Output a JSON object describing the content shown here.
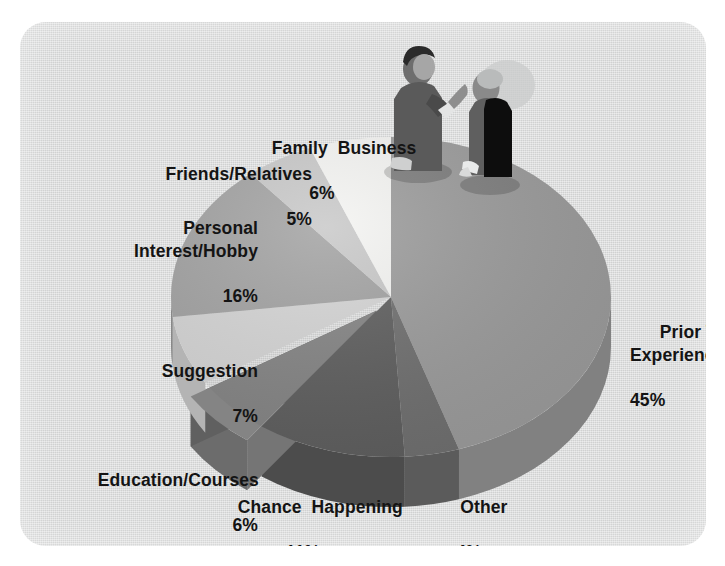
{
  "panel": {
    "background_color": "#d9dada",
    "border_radius_px": 26
  },
  "chart_data": {
    "type": "pie",
    "title": "",
    "subtitle": "",
    "xlabel": "",
    "ylabel": "",
    "style": "3d-exploded-pie",
    "legend_position": "none",
    "labels_position": "outside",
    "value_suffix": "%",
    "total": 100,
    "categories": [
      "Prior Work Experience",
      "Other",
      "Chance Happening",
      "Education/Courses",
      "Suggestion",
      "Personal Interest/Hobby",
      "Friends/Relatives",
      "Family Business"
    ],
    "values": [
      45,
      4,
      11,
      6,
      7,
      16,
      5,
      6
    ],
    "slices": [
      {
        "label": "Prior Work Experience",
        "value": 45,
        "value_text": "45%",
        "color": "#9b9b9b",
        "side_color": "#818181",
        "exploded": false
      },
      {
        "label": "Other",
        "value": 4,
        "value_text": "4%",
        "color": "#6f6f6f",
        "side_color": "#5b5b5b",
        "exploded": false
      },
      {
        "label": "Chance Happening",
        "value": 11,
        "value_text": "11%",
        "color": "#5e5e5e",
        "side_color": "#4c4c4c",
        "exploded": false
      },
      {
        "label": "Education/Courses",
        "value": 6,
        "value_text": "6%",
        "color": "#848484",
        "side_color": "#6c6c6c",
        "exploded": true
      },
      {
        "label": "Suggestion",
        "value": 7,
        "value_text": "7%",
        "color": "#d5d5d5",
        "side_color": "#b4b4b4",
        "exploded": false
      },
      {
        "label": "Personal Interest/Hobby",
        "value": 16,
        "value_text": "16%",
        "color": "#a2a2a2",
        "side_color": "#888888",
        "exploded": false
      },
      {
        "label": "Friends/Relatives",
        "value": 5,
        "value_text": "5%",
        "color": "#c8c8c8",
        "side_color": "#a8a8a8",
        "exploded": false
      },
      {
        "label": "Family Business",
        "value": 6,
        "value_text": "6%",
        "color": "#f4f4f2",
        "side_color": "#d2d2d0",
        "exploded": false
      }
    ]
  },
  "labels": {
    "family_business": {
      "name": "Family  Business",
      "pct": "6%"
    },
    "friends_relatives": {
      "name": "Friends/Relatives",
      "pct": "5%"
    },
    "personal_interest": {
      "name": "Personal\nInterest/Hobby",
      "pct": "16%"
    },
    "suggestion": {
      "name": "Suggestion",
      "pct": "7%"
    },
    "education_courses": {
      "name": "Education/Courses",
      "pct": "6%"
    },
    "chance_happening": {
      "name": "Chance  Happening",
      "pct": "11%"
    },
    "other": {
      "name": "Other",
      "pct": "4%"
    },
    "prior_work": {
      "name": "Prior Work\nExperience",
      "pct": "45%"
    }
  },
  "decoration": {
    "figures": [
      {
        "name": "gray-businessperson-figure",
        "color": "#6b6b6b"
      },
      {
        "name": "black-businessperson-figure",
        "color": "#111111"
      }
    ]
  }
}
